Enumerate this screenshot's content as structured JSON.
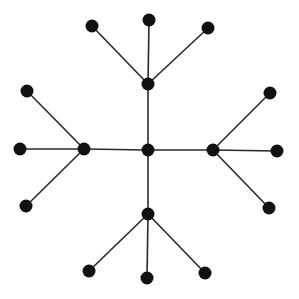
{
  "diagram": {
    "type": "tree",
    "colors": {
      "node": "#111111",
      "edge": "#2a2a2a",
      "background": "#ffffff"
    },
    "node_radius": 6.5,
    "nodes": [
      {
        "id": "center",
        "x": 148,
        "y": 150,
        "role": "root"
      },
      {
        "id": "hub-top",
        "x": 148,
        "y": 84,
        "role": "hub"
      },
      {
        "id": "hub-left",
        "x": 84,
        "y": 149,
        "role": "hub"
      },
      {
        "id": "hub-right",
        "x": 213,
        "y": 150,
        "role": "hub"
      },
      {
        "id": "hub-bottom",
        "x": 148,
        "y": 214,
        "role": "hub"
      },
      {
        "id": "leaf-top-left",
        "x": 92,
        "y": 26,
        "role": "leaf"
      },
      {
        "id": "leaf-top-mid",
        "x": 149,
        "y": 20,
        "role": "leaf"
      },
      {
        "id": "leaf-top-right",
        "x": 208,
        "y": 28,
        "role": "leaf"
      },
      {
        "id": "leaf-left-top",
        "x": 27,
        "y": 91,
        "role": "leaf"
      },
      {
        "id": "leaf-left-mid",
        "x": 20,
        "y": 149,
        "role": "leaf"
      },
      {
        "id": "leaf-left-bottom",
        "x": 26,
        "y": 206,
        "role": "leaf"
      },
      {
        "id": "leaf-right-top",
        "x": 270,
        "y": 93,
        "role": "leaf"
      },
      {
        "id": "leaf-right-mid",
        "x": 277,
        "y": 151,
        "role": "leaf"
      },
      {
        "id": "leaf-right-bottom",
        "x": 269,
        "y": 208,
        "role": "leaf"
      },
      {
        "id": "leaf-bottom-left",
        "x": 89,
        "y": 271,
        "role": "leaf"
      },
      {
        "id": "leaf-bottom-mid",
        "x": 147,
        "y": 278,
        "role": "leaf"
      },
      {
        "id": "leaf-bottom-right",
        "x": 205,
        "y": 273,
        "role": "leaf"
      }
    ],
    "edges": [
      [
        "center",
        "hub-top"
      ],
      [
        "center",
        "hub-left"
      ],
      [
        "center",
        "hub-right"
      ],
      [
        "center",
        "hub-bottom"
      ],
      [
        "hub-top",
        "leaf-top-left"
      ],
      [
        "hub-top",
        "leaf-top-mid"
      ],
      [
        "hub-top",
        "leaf-top-right"
      ],
      [
        "hub-left",
        "leaf-left-top"
      ],
      [
        "hub-left",
        "leaf-left-mid"
      ],
      [
        "hub-left",
        "leaf-left-bottom"
      ],
      [
        "hub-right",
        "leaf-right-top"
      ],
      [
        "hub-right",
        "leaf-right-mid"
      ],
      [
        "hub-right",
        "leaf-right-bottom"
      ],
      [
        "hub-bottom",
        "leaf-bottom-left"
      ],
      [
        "hub-bottom",
        "leaf-bottom-mid"
      ],
      [
        "hub-bottom",
        "leaf-bottom-right"
      ]
    ]
  }
}
